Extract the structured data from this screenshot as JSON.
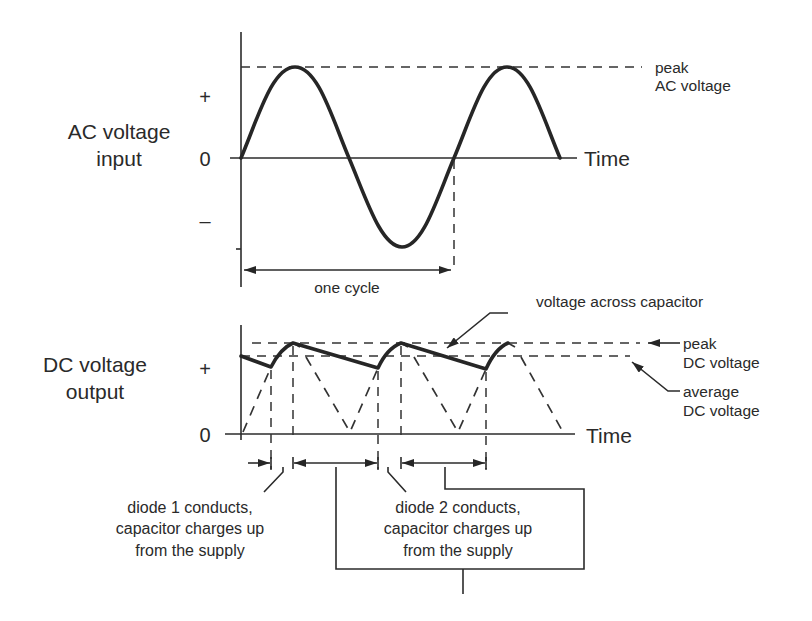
{
  "ac_panel": {
    "title_line1": "AC voltage",
    "title_line2": "input",
    "plus_label": "+",
    "zero_label": "0",
    "minus_label": "–",
    "time_label": "Time",
    "peak_label_line1": "peak",
    "peak_label_line2": "AC voltage",
    "cycle_label": "one cycle"
  },
  "dc_panel": {
    "title_line1": "DC voltage",
    "title_line2": "output",
    "plus_label": "+",
    "zero_label": "0",
    "time_label": "Time",
    "capacitor_label": "voltage across capacitor",
    "peak_label_line1": "peak",
    "peak_label_line2": "DC voltage",
    "average_label_line1": "average",
    "average_label_line2": "DC voltage"
  },
  "annotations": {
    "diode1_line1": "diode 1 conducts,",
    "diode1_line2": "capacitor charges up",
    "diode1_line3": "from the supply",
    "diode2_line1": "diode 2 conducts,",
    "diode2_line2": "capacitor charges up",
    "diode2_line3": "from the supply"
  },
  "colors": {
    "ink": "#2b2b2b",
    "background": "#ffffff"
  }
}
